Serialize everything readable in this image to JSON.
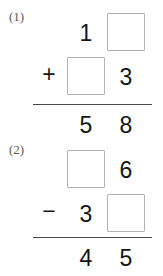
{
  "worksheet": {
    "problems": [
      {
        "label": "(1)",
        "operator": "+",
        "rows": [
          {
            "tens": "1",
            "ones": "",
            "tens_is_blank": false,
            "ones_is_blank": true
          },
          {
            "tens": "",
            "ones": "3",
            "tens_is_blank": true,
            "ones_is_blank": false
          }
        ],
        "answer": {
          "tens": "5",
          "ones": "8"
        }
      },
      {
        "label": "(2)",
        "operator": "−",
        "rows": [
          {
            "tens": "",
            "ones": "6",
            "tens_is_blank": true,
            "ones_is_blank": false
          },
          {
            "tens": "3",
            "ones": "",
            "tens_is_blank": false,
            "ones_is_blank": true
          }
        ],
        "answer": {
          "tens": "4",
          "ones": "5"
        }
      }
    ],
    "colors": {
      "ink": "#141414",
      "label_ink": "#5a5a5a",
      "box_border": "#b2b2b2",
      "rule": "#4a4a4a",
      "background": "#ffffff"
    }
  }
}
